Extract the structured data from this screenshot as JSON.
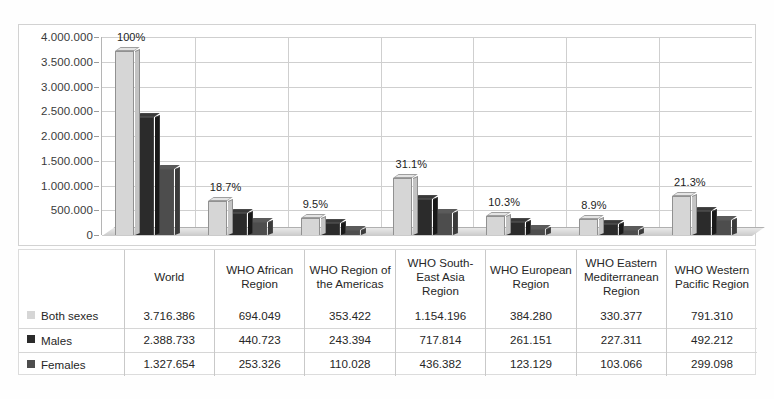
{
  "chart_data": {
    "type": "bar",
    "title": "",
    "xlabel": "",
    "ylabel": "",
    "ylim": [
      0,
      4000000
    ],
    "grid": true,
    "legend_position": "table-left",
    "categories": [
      "World",
      "WHO African Region",
      "WHO Region of the Americas",
      "WHO South-East Asia Region",
      "WHO European Region",
      "WHO Eastern Mediterranean Region",
      "WHO Western Pacific Region"
    ],
    "ytick_labels": [
      "0",
      "500.000",
      "1.000.000",
      "1.500.000",
      "2.000.000",
      "2.500.000",
      "3.000.000",
      "3.500.000",
      "4.000.000"
    ],
    "ytick_values": [
      0,
      500000,
      1000000,
      1500000,
      2000000,
      2500000,
      3000000,
      3500000,
      4000000
    ],
    "annotations": [
      "100%",
      "18.7%",
      "9.5%",
      "31.1%",
      "10.3%",
      "8.9%",
      "21.3%"
    ],
    "series": [
      {
        "name": "Both sexes",
        "color": "#d6d6d6",
        "values": [
          3716386,
          694049,
          353422,
          1154196,
          384280,
          330377,
          791310
        ]
      },
      {
        "name": "Males",
        "color": "#2b2b2b",
        "values": [
          2388733,
          440723,
          243394,
          717814,
          261151,
          227311,
          492212
        ]
      },
      {
        "name": "Females",
        "color": "#4d4d4d",
        "values": [
          1327654,
          253326,
          110028,
          436382,
          123129,
          103066,
          299098
        ]
      }
    ]
  },
  "table": {
    "corner_header": "",
    "column_headers": [
      "World",
      "WHO African Region",
      "WHO Region of the Americas",
      "WHO South-East Asia Region",
      "WHO European Region",
      "WHO Eastern Mediterranean Region",
      "WHO Western Pacific Region"
    ],
    "rows": [
      {
        "label": "Both sexes",
        "swatch": "#d6d6d6",
        "values": [
          "3.716.386",
          "694.049",
          "353.422",
          "1.154.196",
          "384.280",
          "330.377",
          "791.310"
        ]
      },
      {
        "label": "Males",
        "swatch": "#2b2b2b",
        "values": [
          "2.388.733",
          "440.723",
          "243.394",
          "717.814",
          "261.151",
          "227.311",
          "492.212"
        ]
      },
      {
        "label": "Females",
        "swatch": "#4d4d4d",
        "values": [
          "1.327.654",
          "253.326",
          "110.028",
          "436.382",
          "123.129",
          "103.066",
          "299.098"
        ]
      }
    ]
  },
  "colors": {
    "both_sexes": "#d6d6d6",
    "males": "#2b2b2b",
    "females": "#4d4d4d",
    "grid": "#cfcfcf",
    "border": "#d2d2d2",
    "text": "#262626"
  }
}
